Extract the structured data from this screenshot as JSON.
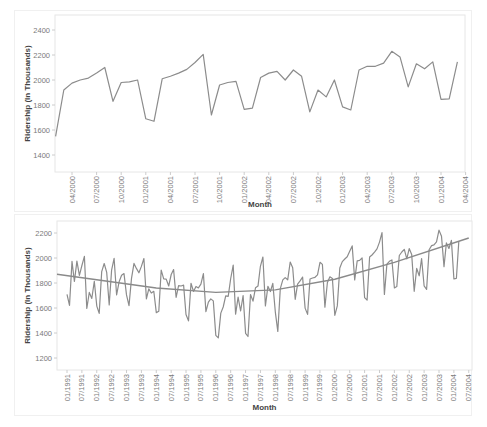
{
  "chart_data": [
    {
      "type": "line",
      "title": "",
      "xlabel": "Month",
      "ylabel": "Ridership (In Thousands)",
      "ylim": [
        1300,
        2500
      ],
      "yticks": [
        1400,
        1600,
        1800,
        2000,
        2200,
        2400
      ],
      "xticks": [
        "04/2000",
        "07/2000",
        "10/2000",
        "01/2001",
        "04/2001",
        "07/2001",
        "10/2001",
        "01/2002",
        "04/2002",
        "07/2002",
        "10/2002",
        "01/2003",
        "04/2003",
        "07/2003",
        "10/2003",
        "01/2004",
        "04/2004"
      ],
      "grid": false,
      "legend": null,
      "series": [
        {
          "name": "Ridership",
          "start_month": "02/2000",
          "values": [
            1550,
            1920,
            1975,
            2000,
            2015,
            2055,
            2100,
            1830,
            1980,
            1985,
            2000,
            1690,
            1670,
            2010,
            2030,
            2055,
            2085,
            2140,
            2205,
            1720,
            1960,
            1980,
            1990,
            1765,
            1775,
            2020,
            2055,
            2070,
            2000,
            2080,
            2030,
            1745,
            1920,
            1865,
            2000,
            1785,
            1760,
            2080,
            2110,
            2110,
            2135,
            2230,
            2185,
            1945,
            2130,
            2090,
            2145,
            1845,
            1850,
            2145
          ]
        }
      ]
    },
    {
      "type": "line",
      "title": "",
      "xlabel": "Month",
      "ylabel": "Ridership (In Thousands)",
      "ylim": [
        1100,
        2300
      ],
      "yticks": [
        1200,
        1400,
        1600,
        1800,
        2000,
        2200
      ],
      "xticks": [
        "01/1991",
        "07/1991",
        "01/1992",
        "07/1992",
        "01/1993",
        "07/1993",
        "01/1994",
        "07/1994",
        "01/1995",
        "07/1995",
        "01/1996",
        "07/1996",
        "01/1997",
        "07/1997",
        "01/1998",
        "07/1998",
        "01/1999",
        "07/1999",
        "01/2000",
        "07/2000",
        "01/2001",
        "07/2001",
        "01/2002",
        "07/2002",
        "01/2003",
        "07/2003",
        "01/2004",
        "07/2004"
      ],
      "grid": false,
      "legend": null,
      "series": [
        {
          "name": "Ridership",
          "start_month": "01/1991",
          "values": [
            1709,
            1621,
            1973,
            1812,
            1975,
            1862,
            1940,
            2013,
            1596,
            1725,
            1676,
            1814,
            1615,
            1557,
            1891,
            1956,
            1885,
            1624,
            1903,
            1997,
            1704,
            1810,
            1862,
            1875,
            1705,
            1619,
            1837,
            1957,
            1917,
            1882,
            1933,
            1996,
            1673,
            1753,
            1720,
            1734,
            1563,
            1574,
            1903,
            1834,
            1831,
            1776,
            1868,
            1907,
            1686,
            1779,
            1776,
            1783,
            1548,
            1497,
            1798,
            1733,
            1772,
            1761,
            1791,
            1875,
            1571,
            1647,
            1673,
            1657,
            1382,
            1361,
            1559,
            1608,
            1697,
            1693,
            1836,
            1943,
            1551,
            1687,
            1576,
            1700,
            1397,
            1372,
            1708,
            1655,
            1762,
            1775,
            1934,
            2008,
            1616,
            1774,
            1732,
            1797,
            1570,
            1413,
            1755,
            1825,
            1843,
            1826,
            1968,
            1922,
            1670,
            1791,
            1817,
            1847,
            1599,
            1549,
            1832,
            1840,
            1846,
            1865,
            1966,
            1949,
            1607,
            1804,
            1850,
            1836,
            1542,
            1617,
            1920,
            1971,
            1992,
            2010,
            2054,
            2097,
            1824,
            1977,
            1981,
            2000,
            1683,
            1663,
            2008,
            2024,
            2047,
            2073,
            2127,
            2203,
            1708,
            1951,
            1974,
            1985,
            1760,
            1771,
            2020,
            2048,
            2069,
            1994,
            2075,
            2027,
            1734,
            1917,
            1858,
            1996,
            1778,
            1749,
            2066,
            2099,
            2105,
            2130,
            2223,
            2174,
            1931,
            2121,
            2076,
            2141,
            1832,
            1838,
            2132
          ]
        },
        {
          "name": "Quadratic trend",
          "type": "trend",
          "shape": "quadratic",
          "approx_points": [
            [
              "01/1991",
              1870
            ],
            [
              "01/1994",
              1760
            ],
            [
              "01/1996",
              1725
            ],
            [
              "01/1998",
              1745
            ],
            [
              "01/2000",
              1830
            ],
            [
              "01/2002",
              1965
            ],
            [
              "07/2004",
              2160
            ]
          ]
        }
      ]
    }
  ]
}
